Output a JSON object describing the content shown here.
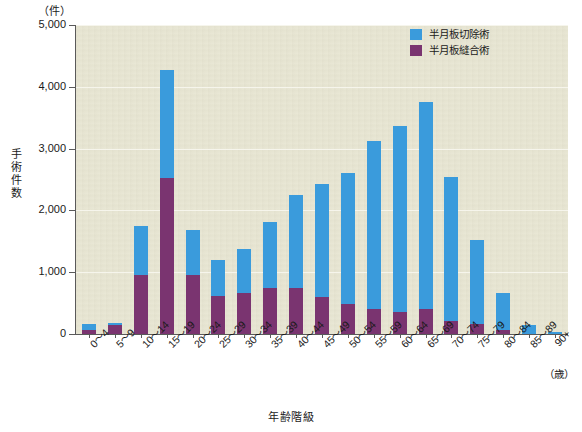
{
  "chart_data": {
    "type": "bar",
    "stacked": true,
    "title": "",
    "unit_label": "（件）",
    "xlabel": "年齢階級",
    "x_axis_unit": "（歳）",
    "ylabel": "手術件数",
    "ylim": [
      0,
      5000
    ],
    "ytick_labels": [
      "5,000",
      "4,000",
      "3,000",
      "2,000",
      "1,000",
      "0"
    ],
    "yticks": [
      5000,
      4000,
      3000,
      2000,
      1000,
      0
    ],
    "grid": true,
    "legend_position": "top-right",
    "categories": [
      "0〜4",
      "5〜9",
      "10〜14",
      "15〜19",
      "20〜24",
      "25〜29",
      "30〜34",
      "35〜39",
      "40〜44",
      "45〜49",
      "50〜54",
      "55〜59",
      "60〜64",
      "65〜69",
      "70〜74",
      "75〜79",
      "80〜84",
      "85〜89",
      "90+"
    ],
    "series": [
      {
        "name": "半月板縫合術",
        "color": "#7a3470",
        "values": [
          60,
          150,
          960,
          2530,
          960,
          610,
          670,
          740,
          740,
          600,
          490,
          410,
          350,
          410,
          215,
          160,
          70,
          0,
          0
        ]
      },
      {
        "name": "半月板切除術",
        "color": "#3a9bdc",
        "values": [
          100,
          30,
          790,
          1750,
          720,
          580,
          710,
          1070,
          1510,
          1820,
          2110,
          2720,
          3010,
          3350,
          2330,
          1360,
          600,
          150,
          30
        ]
      }
    ],
    "totals": [
      160,
      180,
      1750,
      4280,
      1680,
      1190,
      1380,
      1810,
      2250,
      2420,
      2600,
      3130,
      3360,
      3760,
      2545,
      1520,
      670,
      150,
      30
    ]
  },
  "legend": {
    "items": [
      {
        "label": "半月板切除術",
        "color": "#3a9bdc"
      },
      {
        "label": "半月板縫合術",
        "color": "#7a3470"
      }
    ]
  },
  "colors": {
    "blue": "#3a9bdc",
    "purple": "#7a3470",
    "plot_background": "#e7e5d2",
    "axis": "#5a5a5a",
    "gridline": "#f6f5ec"
  }
}
